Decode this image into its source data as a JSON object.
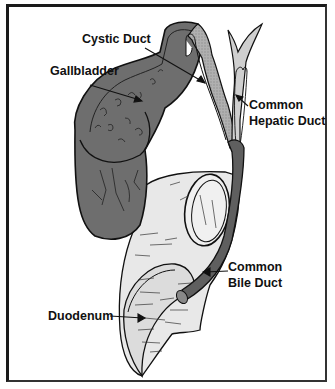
{
  "diagram": {
    "type": "anatomical-illustration",
    "labels": {
      "cystic_duct": "Cystic Duct",
      "gallbladder": "Gallbladder",
      "common_hepatic_duct_line1": "Common",
      "common_hepatic_duct_line2": "Hepatic Duct",
      "common_bile_duct_line1": "Common",
      "common_bile_duct_line2": "Bile Duct",
      "duodenum": "Duodenum"
    },
    "colors": {
      "gallbladder_fill": "#6e6e6e",
      "gallbladder_wall": "#8a8a8a",
      "cystic_duct_fill": "#b4b4b4",
      "hepatic_duct_fill": "#cfcfcf",
      "bile_duct_fill": "#5f5f5f",
      "duodenum_fill": "#e6e6e6",
      "outline": "#111111",
      "frame": "#1a1a1a"
    }
  }
}
